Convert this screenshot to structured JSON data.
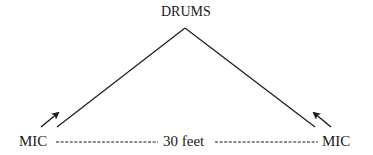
{
  "diagram": {
    "labels": {
      "source": "DRUMS",
      "mic_left": "MIC",
      "mic_right": "MIC",
      "distance": "30 feet"
    },
    "nodes": [
      {
        "id": "drums",
        "label": "DRUMS",
        "x": 185,
        "y": 28
      },
      {
        "id": "mic-left",
        "label": "MIC",
        "x": 57,
        "y": 127
      },
      {
        "id": "mic-right",
        "label": "MIC",
        "x": 315,
        "y": 127
      }
    ],
    "edges": [
      {
        "from": "drums",
        "to": "mic-left",
        "style": "solid"
      },
      {
        "from": "drums",
        "to": "mic-right",
        "style": "solid"
      },
      {
        "from": "mic-left",
        "to": "mic-right",
        "style": "dashed",
        "label": "30 feet"
      }
    ],
    "line_color": "#1a1a1a"
  }
}
